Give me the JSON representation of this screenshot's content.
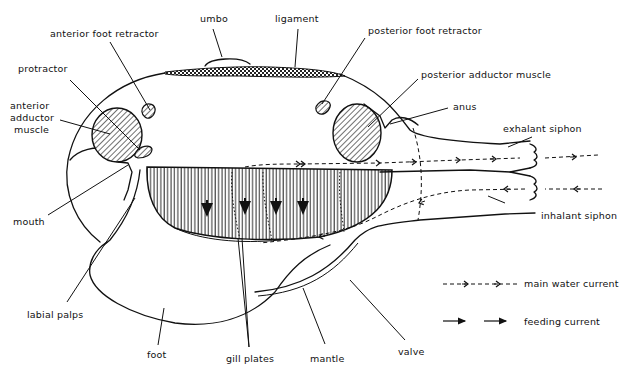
{
  "labels": {
    "umbo": "umbo",
    "ligament": "ligament",
    "anterior_foot_retractor": "anterior foot retractor",
    "posterior_foot_retractor": "posterior foot retractor",
    "protractor": "protractor",
    "posterior_adductor_muscle": "posterior adductor muscle",
    "anterior_adductor_line1": "anterior",
    "anterior_adductor_line2": "adductor",
    "anterior_adductor_line3": "muscle",
    "anus": "anus",
    "exhalant_siphon": "exhalant siphon",
    "inhalant_siphon": "inhalant siphon",
    "mouth": "mouth",
    "labial_palps": "labial palps",
    "foot": "foot",
    "gill_plates": "gill plates",
    "mantle": "mantle",
    "valve": "valve"
  },
  "legend": {
    "main_water_current": "main water current",
    "feeding_current": "feeding current"
  },
  "colors": {
    "ink": "#111111",
    "background": "#ffffff"
  }
}
